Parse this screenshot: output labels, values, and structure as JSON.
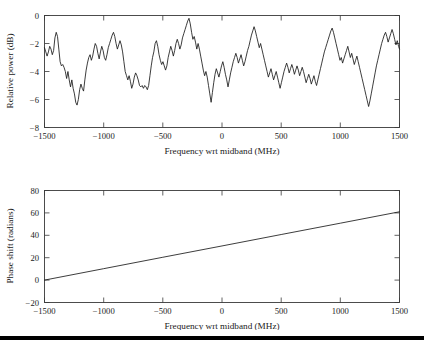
{
  "figure": {
    "background_color": "#ffffff",
    "line_color": "#1a1a1a",
    "axis_color": "#3a3a3a",
    "page_rule_color": "#000000"
  },
  "chart_data": [
    {
      "type": "line",
      "panel": "top",
      "title": "",
      "xlabel": "Frequency wrt midband (MHz)",
      "ylabel": "Relative power (dB)",
      "xlim": [
        -1500,
        1500
      ],
      "ylim": [
        -8,
        0
      ],
      "xticks": [
        -1500,
        -1000,
        -500,
        0,
        500,
        1000,
        1500
      ],
      "xticklabels": [
        "−1500",
        "−1000",
        "−500",
        "0",
        "500",
        "1000",
        "1500"
      ],
      "yticks": [
        -8,
        -6,
        -4,
        -2,
        0
      ],
      "yticklabels": [
        "−8",
        "−6",
        "−4",
        "−2",
        "0"
      ],
      "grid": false,
      "legend": null,
      "series": [
        {
          "name": "Relative power",
          "x": [
            -1500,
            -1489,
            -1478,
            -1467,
            -1456,
            -1445,
            -1434,
            -1423,
            -1412,
            -1401,
            -1390,
            -1379,
            -1368,
            -1357,
            -1346,
            -1335,
            -1324,
            -1313,
            -1302,
            -1291,
            -1280,
            -1269,
            -1258,
            -1247,
            -1236,
            -1225,
            -1214,
            -1203,
            -1192,
            -1181,
            -1170,
            -1159,
            -1148,
            -1137,
            -1126,
            -1115,
            -1104,
            -1093,
            -1082,
            -1071,
            -1060,
            -1049,
            -1038,
            -1027,
            -1016,
            -1005,
            -994,
            -983,
            -972,
            -961,
            -950,
            -939,
            -928,
            -917,
            -906,
            -895,
            -884,
            -873,
            -862,
            -851,
            -840,
            -829,
            -818,
            -807,
            -796,
            -785,
            -774,
            -763,
            -752,
            -741,
            -730,
            -719,
            -708,
            -697,
            -686,
            -675,
            -664,
            -653,
            -642,
            -631,
            -620,
            -609,
            -598,
            -587,
            -576,
            -565,
            -554,
            -543,
            -532,
            -521,
            -510,
            -499,
            -488,
            -477,
            -466,
            -455,
            -444,
            -433,
            -422,
            -411,
            -400,
            -389,
            -378,
            -367,
            -356,
            -345,
            -334,
            -323,
            -312,
            -301,
            -290,
            -279,
            -268,
            -257,
            -246,
            -235,
            -224,
            -213,
            -202,
            -191,
            -180,
            -169,
            -158,
            -147,
            -136,
            -125,
            -114,
            -103,
            -92,
            -81,
            -70,
            -59,
            -48,
            -37,
            -26,
            -15,
            -4,
            7,
            18,
            29,
            40,
            51,
            62,
            73,
            84,
            95,
            106,
            117,
            128,
            139,
            150,
            161,
            172,
            183,
            194,
            205,
            216,
            227,
            238,
            249,
            260,
            271,
            282,
            293,
            304,
            315,
            326,
            337,
            348,
            359,
            370,
            381,
            392,
            403,
            414,
            425,
            436,
            447,
            458,
            469,
            480,
            491,
            502,
            513,
            524,
            535,
            546,
            557,
            568,
            579,
            590,
            601,
            612,
            623,
            634,
            645,
            656,
            667,
            678,
            689,
            700,
            711,
            722,
            733,
            744,
            755,
            766,
            777,
            788,
            799,
            810,
            821,
            832,
            843,
            854,
            865,
            876,
            887,
            898,
            909,
            920,
            931,
            942,
            953,
            964,
            975,
            986,
            997,
            1008,
            1019,
            1030,
            1041,
            1052,
            1063,
            1074,
            1085,
            1096,
            1107,
            1118,
            1129,
            1140,
            1151,
            1162,
            1173,
            1184,
            1195,
            1206,
            1217,
            1228,
            1239,
            1250,
            1261,
            1272,
            1283,
            1294,
            1305,
            1316,
            1327,
            1338,
            1349,
            1360,
            1371,
            1382,
            1393,
            1404,
            1415,
            1426,
            1437,
            1448,
            1459,
            1470,
            1481,
            1492,
            1500
          ],
          "y": [
            -2.3,
            -2.6,
            -2.9,
            -2.6,
            -2.2,
            -2.4,
            -2.8,
            -2.5,
            -1.6,
            -1.2,
            -1.5,
            -2.4,
            -3.3,
            -3.6,
            -3.5,
            -3.7,
            -4.0,
            -4.5,
            -4.0,
            -4.6,
            -5.1,
            -4.6,
            -5.2,
            -5.6,
            -6.2,
            -6.4,
            -6.0,
            -5.3,
            -4.9,
            -5.2,
            -5.4,
            -4.6,
            -3.9,
            -3.4,
            -3.0,
            -2.8,
            -3.2,
            -2.9,
            -2.4,
            -2.0,
            -2.2,
            -2.7,
            -3.1,
            -2.6,
            -2.2,
            -2.5,
            -3.0,
            -3.2,
            -2.8,
            -2.3,
            -2.0,
            -1.7,
            -1.4,
            -1.2,
            -1.5,
            -2.0,
            -2.4,
            -2.1,
            -1.8,
            -2.1,
            -2.6,
            -3.3,
            -4.0,
            -4.3,
            -4.6,
            -4.3,
            -4.7,
            -5.2,
            -4.9,
            -4.4,
            -4.1,
            -4.3,
            -4.6,
            -5.0,
            -5.1,
            -5.0,
            -5.2,
            -5.0,
            -5.1,
            -5.3,
            -5.0,
            -4.3,
            -3.6,
            -3.0,
            -2.6,
            -2.0,
            -1.8,
            -2.2,
            -2.8,
            -3.2,
            -3.5,
            -3.3,
            -3.6,
            -3.9,
            -3.6,
            -3.0,
            -2.6,
            -2.2,
            -2.5,
            -2.9,
            -2.5,
            -2.0,
            -1.7,
            -2.0,
            -2.4,
            -2.1,
            -1.6,
            -1.3,
            -1.0,
            -0.7,
            -0.4,
            -0.2,
            -0.6,
            -1.2,
            -1.7,
            -1.5,
            -1.9,
            -2.4,
            -2.0,
            -2.4,
            -2.9,
            -3.4,
            -3.9,
            -4.3,
            -4.0,
            -4.4,
            -5.0,
            -5.6,
            -6.2,
            -5.5,
            -4.8,
            -4.2,
            -3.8,
            -4.1,
            -4.4,
            -4.0,
            -3.6,
            -3.3,
            -3.7,
            -4.2,
            -4.6,
            -5.1,
            -4.6,
            -4.1,
            -3.7,
            -3.3,
            -3.0,
            -2.7,
            -3.0,
            -3.4,
            -3.1,
            -2.8,
            -3.2,
            -3.6,
            -3.3,
            -2.9,
            -2.5,
            -2.2,
            -1.8,
            -1.4,
            -1.1,
            -0.8,
            -1.1,
            -1.5,
            -1.9,
            -2.3,
            -2.0,
            -2.4,
            -2.8,
            -3.2,
            -3.6,
            -4.0,
            -4.4,
            -4.1,
            -3.8,
            -4.2,
            -4.6,
            -4.3,
            -4.0,
            -4.4,
            -4.8,
            -5.2,
            -4.8,
            -4.4,
            -4.0,
            -3.7,
            -3.4,
            -3.7,
            -4.1,
            -3.8,
            -3.5,
            -3.8,
            -4.2,
            -3.9,
            -3.6,
            -3.9,
            -4.3,
            -4.0,
            -3.7,
            -4.0,
            -4.4,
            -4.8,
            -4.5,
            -4.2,
            -4.5,
            -4.9,
            -4.6,
            -4.3,
            -4.7,
            -5.0,
            -4.6,
            -4.2,
            -3.8,
            -3.4,
            -3.0,
            -2.6,
            -2.3,
            -2.0,
            -1.7,
            -1.4,
            -1.1,
            -0.9,
            -1.2,
            -1.6,
            -2.0,
            -2.4,
            -2.8,
            -3.2,
            -3.0,
            -3.4,
            -3.1,
            -2.8,
            -2.5,
            -2.2,
            -2.6,
            -3.0,
            -2.7,
            -3.1,
            -3.5,
            -3.2,
            -2.9,
            -3.3,
            -3.7,
            -4.1,
            -4.5,
            -4.9,
            -5.3,
            -5.7,
            -6.1,
            -6.5,
            -6.1,
            -5.6,
            -5.1,
            -4.6,
            -4.1,
            -3.6,
            -3.2,
            -2.8,
            -2.4,
            -2.0,
            -1.7,
            -1.4,
            -1.2,
            -1.5,
            -1.9,
            -1.6,
            -1.3,
            -1.0,
            -1.3,
            -1.7,
            -2.1,
            -1.8,
            -2.2,
            -2.4
          ],
          "note": "Noisy bandpass ripple; peaks near 0 dB, deepest null about -7.1 dB near +715 MHz"
        }
      ]
    },
    {
      "type": "line",
      "panel": "bottom",
      "title": "",
      "xlabel": "Frequency wrt midband (MHz)",
      "ylabel": "Phase shift (radians)",
      "xlim": [
        -1500,
        1500
      ],
      "ylim": [
        -20,
        80
      ],
      "xticks": [
        -1500,
        -1000,
        -500,
        0,
        500,
        1000,
        1500
      ],
      "xticklabels": [
        "−1500",
        "−1000",
        "−500",
        "0",
        "500",
        "1000",
        "1500"
      ],
      "yticks": [
        -20,
        0,
        20,
        40,
        60,
        80
      ],
      "yticklabels": [
        "−20",
        "0",
        "20",
        "40",
        "60",
        "80"
      ],
      "grid": false,
      "legend": null,
      "series": [
        {
          "name": "Phase shift",
          "x": [
            -1500,
            -1000,
            -500,
            0,
            500,
            1000,
            1500
          ],
          "y": [
            0,
            10.2,
            20.4,
            30.5,
            40.7,
            50.8,
            61.0
          ],
          "note": "Linear phase ramp, slope about 0.0203 radians per MHz"
        }
      ]
    }
  ]
}
